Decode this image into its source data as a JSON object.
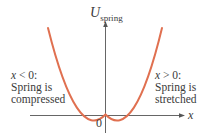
{
  "diagram": {
    "y_axis_label": "U",
    "y_axis_subscript": "spring",
    "x_axis_label": "x",
    "origin_label": "0",
    "left_region": {
      "condition_var": "x",
      "condition_rest": " < 0:",
      "line1": "Spring is",
      "line2": "compressed"
    },
    "right_region": {
      "condition_var": "x",
      "condition_rest": " > 0:",
      "line1": "Spring is",
      "line2": "stretched"
    },
    "curve": {
      "shape": "parabola",
      "vertex": [
        0,
        0
      ],
      "color": "#e07050"
    },
    "axis_color": "#555555"
  }
}
